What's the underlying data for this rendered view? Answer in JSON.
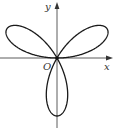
{
  "figure": {
    "curve": {
      "type": "polar-rose",
      "equation": "r = a sin(3θ)",
      "petals": 3,
      "petal_directions_deg": [
        30,
        150,
        270
      ],
      "stroke_color": "#1a1a1a"
    },
    "axes": {
      "x_label": "x",
      "y_label": "y",
      "origin_label": "O",
      "color": "#333333"
    }
  }
}
